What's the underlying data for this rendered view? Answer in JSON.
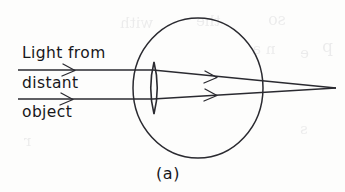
{
  "figure": {
    "caption": "(a)",
    "background_color": "#fdfdfc",
    "ink_color": "#2a2a30"
  },
  "labels": {
    "line1": "Light from",
    "line2": "distant",
    "line3": "object"
  },
  "ghost_showthrough": [
    {
      "text": "with",
      "x": 120,
      "y": 14
    },
    {
      "text": "the",
      "x": 196,
      "y": 12
    },
    {
      "text": "so",
      "x": 268,
      "y": 10
    },
    {
      "text": "p",
      "x": 322,
      "y": 36
    },
    {
      "text": "n a",
      "x": 252,
      "y": 40
    },
    {
      "text": "e",
      "x": 300,
      "y": 44
    },
    {
      "text": "r",
      "x": 24,
      "y": 132
    },
    {
      "text": "s",
      "x": 300,
      "y": 120
    }
  ],
  "geometry": {
    "eyeball": {
      "cx": 198,
      "cy": 88,
      "rx": 65,
      "ry": 70
    },
    "lens": {
      "cx": 154,
      "cy": 88,
      "half_width": 5.5,
      "half_height": 26
    },
    "focal_point": {
      "x": 318,
      "y": 88
    },
    "incoming_rays": [
      {
        "name": "upper-ray",
        "x1": 18,
        "y1": 70,
        "x2": 152,
        "y2": 70
      },
      {
        "name": "lower-ray",
        "x1": 18,
        "y1": 99,
        "x2": 152,
        "y2": 99
      }
    ],
    "refracted_rays": [
      {
        "name": "upper-refracted-ray",
        "x1": 152,
        "y1": 70,
        "x2": 334,
        "y2": 88
      },
      {
        "name": "lower-refracted-ray",
        "x1": 152,
        "y1": 99,
        "x2": 334,
        "y2": 88
      }
    ],
    "arrowheads": [
      {
        "name": "arrowhead-incoming-upper",
        "x": 72,
        "y": 70,
        "angle": 0
      },
      {
        "name": "arrowhead-incoming-lower",
        "x": 70,
        "y": 99,
        "angle": 0
      },
      {
        "name": "arrowhead-refracted-upper",
        "x": 214,
        "y": 76,
        "angle": 6
      },
      {
        "name": "arrowhead-refracted-lower",
        "x": 214,
        "y": 95,
        "angle": -4
      }
    ]
  }
}
